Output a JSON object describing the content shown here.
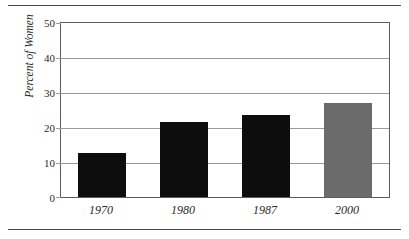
{
  "chart_data": {
    "type": "bar",
    "title": "",
    "subtitle": "",
    "xlabel": "",
    "ylabel": "Percent of Women",
    "categories": [
      "1970",
      "1980",
      "1987",
      "2000"
    ],
    "values": [
      12.6,
      21.5,
      23.6,
      26.9
    ],
    "series": [
      {
        "name": "Percent of Women",
        "values": [
          12.6,
          21.5,
          23.6,
          26.9
        ]
      }
    ],
    "bar_colors": [
      "#0d0d0d",
      "#0d0d0d",
      "#0d0d0d",
      "#6b6b6b"
    ],
    "ylim": [
      0,
      50
    ],
    "ytick_values": [
      0,
      10,
      20,
      30,
      40,
      50
    ],
    "ytick_labels": [
      "0",
      "10",
      "20",
      "30",
      "40",
      "50"
    ],
    "xtick_labels": [
      "1970",
      "1980",
      "1987",
      "2000"
    ],
    "grid": "horizontal",
    "legend": "none",
    "frame": true,
    "annotations": []
  },
  "axis": {
    "y_label": "Percent of Women",
    "ticks": {
      "t50": "50",
      "t40": "40",
      "t30": "30",
      "t20": "20",
      "t10": "10",
      "t0": "0"
    }
  },
  "xlabels": {
    "c0": "1970",
    "c1": "1980",
    "c2": "1987",
    "c3": "2000"
  },
  "colors": {
    "bar_black": "#0d0d0d",
    "bar_gray": "#6b6b6b",
    "gridline": "#9a9a9a",
    "frame": "#5c5c5c",
    "rule": "#4a4a4a",
    "text": "#2b2b2b",
    "background": "#ffffff"
  }
}
